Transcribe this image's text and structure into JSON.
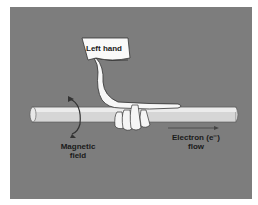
{
  "figure": {
    "labels": {
      "hand": "Left hand",
      "field_line1": "Magnetic",
      "field_line2": "field",
      "flow_line1": "Electron (e⁻)",
      "flow_line2": "flow"
    },
    "colors": {
      "background": "#7d7d7d",
      "conductor": "#d9d9d9",
      "hand": "#f5f5f5",
      "text": "#1a1a1a"
    }
  }
}
